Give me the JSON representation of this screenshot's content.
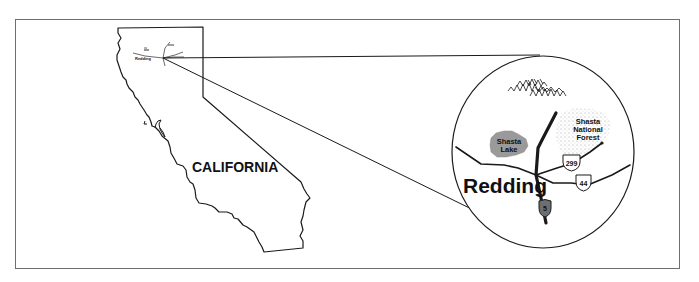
{
  "figure": {
    "type": "locator-map",
    "state_map": {
      "state_label": "CALIFORNIA",
      "inset_city_label": "Redding"
    },
    "detail_circle": {
      "city_label": "Redding",
      "lake_label_line1": "Shasta",
      "lake_label_line2": "Lake",
      "forest_label_line1": "Shasta",
      "forest_label_line2": "National",
      "forest_label_line3": "Forest",
      "routes": [
        {
          "id": "I-5",
          "label": "5",
          "shield": "interstate",
          "fill": "#6e6e6e"
        },
        {
          "id": "299",
          "label": "299",
          "shield": "us-highway",
          "fill": "#ffffff"
        },
        {
          "id": "44",
          "label": "44",
          "shield": "us-highway",
          "fill": "#ffffff"
        }
      ],
      "features": [
        "mountains",
        "lake",
        "national-forest",
        "highways"
      ]
    },
    "colors": {
      "line": "#1a1a1a",
      "frame": "#6f6f6f",
      "lake": "#9a9a9a",
      "forest_stipple": "#b0b0b0",
      "background": "#ffffff"
    }
  }
}
